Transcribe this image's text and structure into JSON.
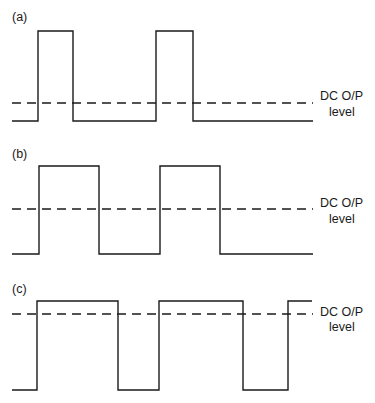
{
  "figure": {
    "panels": [
      {
        "id": "a",
        "label": "(a)",
        "label_pos": [
          12,
          21
        ],
        "high_y": 31,
        "low_y": 121,
        "dc_y": 103,
        "x_start": 12,
        "x_end": 313,
        "edges": [
          38,
          73,
          156,
          193
        ],
        "start_level": "low",
        "dc_label_line1": "DC O/P",
        "dc_label_line2": "level",
        "dc_label_pos": [
          320,
          100,
          116
        ]
      },
      {
        "id": "b",
        "label": "(b)",
        "label_pos": [
          12,
          158
        ],
        "high_y": 166,
        "low_y": 254,
        "dc_y": 209,
        "x_start": 12,
        "x_end": 313,
        "edges": [
          39,
          99,
          160,
          220
        ],
        "start_level": "low",
        "dc_label_line1": "DC O/P",
        "dc_label_line2": "level",
        "dc_label_pos": [
          320,
          207,
          223
        ]
      },
      {
        "id": "c",
        "label": "(c)",
        "label_pos": [
          12,
          293
        ],
        "high_y": 301,
        "low_y": 390,
        "dc_y": 314,
        "x_start": 12,
        "x_end": 312,
        "edges": [
          37,
          118,
          159,
          243,
          288
        ],
        "start_level": "low",
        "dc_label_line1": "DC O/P",
        "dc_label_line2": "level",
        "dc_label_pos": [
          320,
          316,
          331
        ]
      }
    ]
  },
  "chart_data": {
    "type": "line",
    "title": "",
    "series": [
      {
        "name": "(a) narrow pulses",
        "duty_cycle_approx": 0.24,
        "dc_level_fraction_of_peak": 0.2,
        "dc_label": "DC O/P level"
      },
      {
        "name": "(b) 50% square wave",
        "duty_cycle_approx": 0.5,
        "dc_level_fraction_of_peak": 0.5,
        "dc_label": "DC O/P level"
      },
      {
        "name": "(c) wide pulses",
        "duty_cycle_approx": 0.66,
        "dc_level_fraction_of_peak": 0.86,
        "dc_label": "DC O/P level"
      }
    ],
    "xlabel": "",
    "ylabel": ""
  }
}
